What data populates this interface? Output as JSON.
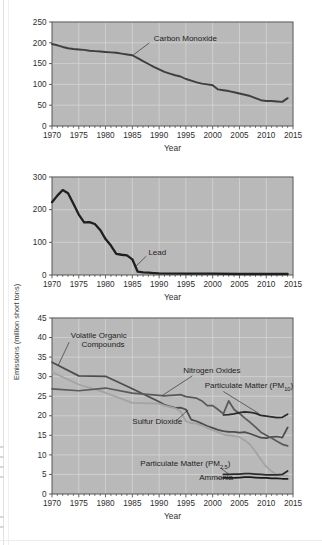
{
  "figure": {
    "y_axis_label": "Emissions (million short tons)",
    "background": "#ffffff",
    "plot_background": "#b9b9b9",
    "gridline_color": "#d8d8d8",
    "axis_color": "#4a4a4a"
  },
  "panels": [
    {
      "id": "panel-carbon-monoxide",
      "xlabel": "Year",
      "ylim": [
        0,
        250
      ],
      "yticks": [
        0,
        50,
        100,
        150,
        200,
        250
      ],
      "xlim": [
        1970,
        2015
      ],
      "xticks": [
        1970,
        1975,
        1980,
        1985,
        1990,
        1995,
        2000,
        2005,
        2010,
        2015
      ],
      "annotations": [
        {
          "text": "Carbon Monoxide",
          "x": 1989,
          "y": 205
        }
      ]
    },
    {
      "id": "panel-lead",
      "xlabel": "Year",
      "ylim": [
        0,
        300
      ],
      "yticks": [
        0,
        100,
        200,
        300
      ],
      "xlim": [
        1970,
        2015
      ],
      "xticks": [
        1970,
        1975,
        1980,
        1985,
        1990,
        1995,
        2000,
        2005,
        2010,
        2015
      ],
      "annotations": [
        {
          "text": "Lead",
          "x": 1988,
          "y": 62
        }
      ]
    },
    {
      "id": "panel-multi",
      "xlabel": "Year",
      "ylim": [
        0,
        45
      ],
      "yticks": [
        0,
        5,
        10,
        15,
        20,
        25,
        30,
        35,
        40,
        45
      ],
      "xlim": [
        1970,
        2015
      ],
      "xticks": [
        1970,
        1975,
        1980,
        1985,
        1990,
        1995,
        2000,
        2005,
        2010,
        2015
      ],
      "annotations": [
        {
          "text": "Volatile Organic",
          "x": 1973.5,
          "y": 40.0
        },
        {
          "text": "Compounds",
          "x": 1975.5,
          "y": 37.6
        },
        {
          "text": "Nitrogen Oxides",
          "x": 1994.5,
          "y": 31.0
        },
        {
          "text": "Particulate Matter (PM10)",
          "x": 1998.5,
          "y": 27.2
        },
        {
          "text": "Sulfur Dioxide",
          "x": 1985.0,
          "y": 18.0
        },
        {
          "text": "Particulate Matter (PM2.5)",
          "x": 1986.5,
          "y": 7.1
        },
        {
          "text": "Ammonia",
          "x": 1997.5,
          "y": 3.6
        }
      ]
    }
  ],
  "chart_data": [
    {
      "type": "line",
      "title": "",
      "xlabel": "Year",
      "ylabel": "Emissions (million short tons)",
      "xlim": [
        1970,
        2015
      ],
      "ylim": [
        0,
        250
      ],
      "grid": true,
      "legend_position": "inline-annotation",
      "series": [
        {
          "name": "Carbon Monoxide",
          "color": "#3f3f3f",
          "x": [
            1970,
            1971,
            1972,
            1973,
            1974,
            1975,
            1976,
            1977,
            1978,
            1979,
            1980,
            1981,
            1982,
            1983,
            1984,
            1985,
            1986,
            1987,
            1988,
            1989,
            1990,
            1991,
            1992,
            1993,
            1994,
            1995,
            1996,
            1997,
            1998,
            1999,
            2000,
            2001,
            2002,
            2003,
            2004,
            2005,
            2006,
            2007,
            2008,
            2009,
            2010,
            2011,
            2012,
            2013,
            2014
          ],
          "values": [
            197,
            194,
            190,
            187,
            185,
            184,
            183,
            181,
            180,
            179,
            178,
            177,
            176,
            174,
            172,
            170,
            163,
            156,
            149,
            142,
            136,
            130,
            126,
            122,
            119,
            113,
            109,
            105,
            102,
            100,
            98,
            88,
            86,
            84,
            81,
            78,
            75,
            72,
            67,
            62,
            60,
            60,
            59,
            58,
            67
          ]
        }
      ]
    },
    {
      "type": "line",
      "title": "",
      "xlabel": "Year",
      "ylabel": "Emissions (million short tons)",
      "xlim": [
        1970,
        2015
      ],
      "ylim": [
        0,
        300
      ],
      "grid": true,
      "legend_position": "inline-annotation",
      "series": [
        {
          "name": "Lead",
          "color": "#1f1f1f",
          "x": [
            1970,
            1971,
            1972,
            1973,
            1974,
            1975,
            1976,
            1977,
            1978,
            1979,
            1980,
            1981,
            1982,
            1983,
            1984,
            1985,
            1986,
            1987,
            1988,
            1989,
            1990,
            1995,
            2000,
            2005,
            2010,
            2014
          ],
          "values": [
            223,
            243,
            260,
            250,
            218,
            185,
            161,
            162,
            156,
            138,
            110,
            90,
            65,
            62,
            60,
            48,
            10,
            8,
            7,
            6,
            5,
            4,
            4,
            3,
            3,
            3
          ]
        }
      ]
    },
    {
      "type": "line",
      "title": "",
      "xlabel": "Year",
      "ylabel": "Emissions (million short tons)",
      "xlim": [
        1970,
        2015
      ],
      "ylim": [
        0,
        45
      ],
      "grid": true,
      "legend_position": "inline-annotation",
      "series": [
        {
          "name": "Volatile Organic Compounds",
          "color": "#4d4d4d",
          "x": [
            1970,
            1975,
            1980,
            1985,
            1990,
            1991,
            1992,
            1993,
            1994,
            1995,
            1996,
            1997,
            1998,
            1999,
            2000,
            2001,
            2002,
            2003,
            2004,
            2005,
            2006,
            2007,
            2008,
            2009,
            2010,
            2011,
            2012,
            2013,
            2014
          ],
          "values": [
            33.7,
            30.2,
            30.1,
            26.9,
            23.6,
            22.8,
            22.4,
            22.0,
            22.1,
            21.6,
            19.0,
            18.6,
            18.0,
            17.4,
            16.9,
            16.4,
            16.1,
            15.9,
            15.9,
            15.7,
            15.8,
            15.4,
            14.9,
            14.4,
            14.3,
            14.6,
            14.7,
            14.4,
            17.0
          ]
        },
        {
          "name": "Sulfur Dioxide",
          "color": "#a3a3a3",
          "x": [
            1970,
            1975,
            1980,
            1985,
            1990,
            1991,
            1992,
            1993,
            1994,
            1995,
            1996,
            1997,
            1998,
            1999,
            2000,
            2001,
            2002,
            2003,
            2004,
            2005,
            2006,
            2007,
            2008,
            2009,
            2010,
            2011,
            2012,
            2013,
            2014
          ],
          "values": [
            31.2,
            28.0,
            25.9,
            23.3,
            23.1,
            22.6,
            22.3,
            21.9,
            21.1,
            18.6,
            18.1,
            18.0,
            17.5,
            16.9,
            16.3,
            15.8,
            15.2,
            15.0,
            14.8,
            14.6,
            13.7,
            12.6,
            10.8,
            8.8,
            7.0,
            5.8,
            4.9,
            4.7,
            4.7
          ]
        },
        {
          "name": "Nitrogen Oxides",
          "color": "#5a5a5a",
          "x": [
            1970,
            1975,
            1980,
            1985,
            1990,
            1991,
            1992,
            1993,
            1994,
            1995,
            1996,
            1997,
            1998,
            1999,
            2000,
            2001,
            2002,
            2003,
            2004,
            2005,
            2006,
            2007,
            2008,
            2009,
            2010,
            2011,
            2012,
            2013,
            2014
          ],
          "values": [
            26.9,
            26.4,
            27.1,
            25.8,
            25.2,
            25.1,
            25.2,
            25.3,
            25.4,
            24.9,
            24.7,
            24.5,
            23.8,
            22.6,
            22.6,
            21.6,
            20.5,
            23.8,
            21.6,
            20.6,
            19.4,
            18.3,
            17.1,
            15.8,
            15.0,
            14.3,
            13.5,
            12.7,
            12.3
          ]
        },
        {
          "name": "Particulate Matter (PM10)",
          "color": "#2b2b2b",
          "x": [
            2002,
            2003,
            2004,
            2005,
            2006,
            2007,
            2008,
            2009,
            2010,
            2011,
            2012,
            2013,
            2014
          ],
          "values": [
            20.2,
            20.3,
            20.5,
            20.8,
            21.0,
            20.9,
            20.6,
            20.1,
            19.9,
            19.7,
            19.5,
            19.6,
            20.4
          ]
        },
        {
          "name": "Particulate Matter (PM2.5)",
          "color": "#2b2b2b",
          "x": [
            2002,
            2003,
            2004,
            2005,
            2006,
            2007,
            2008,
            2009,
            2010,
            2011,
            2012,
            2013,
            2014
          ],
          "values": [
            5.0,
            5.0,
            5.1,
            5.1,
            5.2,
            5.2,
            5.1,
            5.0,
            4.9,
            4.9,
            4.9,
            5.0,
            5.9
          ]
        },
        {
          "name": "Ammonia",
          "color": "#1a1a1a",
          "x": [
            2002,
            2003,
            2004,
            2005,
            2006,
            2007,
            2008,
            2009,
            2010,
            2011,
            2012,
            2013,
            2014
          ],
          "values": [
            4.1,
            4.1,
            4.1,
            4.2,
            4.3,
            4.3,
            4.2,
            4.1,
            4.1,
            4.0,
            4.0,
            3.9,
            3.9
          ]
        }
      ]
    }
  ]
}
